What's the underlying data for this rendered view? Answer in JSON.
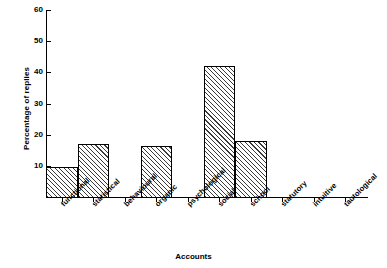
{
  "chart_data": {
    "type": "bar",
    "title": "",
    "xlabel": "Accounts",
    "ylabel": "Percentage of replies",
    "categories": [
      "functional",
      "statistical",
      "behavioural",
      "organic",
      "psychological",
      "social",
      "school",
      "statutory",
      "intuitive",
      "tautological"
    ],
    "values": [
      9.5,
      17,
      0,
      16.5,
      0,
      42,
      18,
      0,
      0,
      0
    ],
    "ylim": [
      0,
      60
    ],
    "yticks": [
      10,
      20,
      30,
      40,
      50,
      60
    ],
    "ytick_labels": [
      "10",
      "20",
      "30",
      "40",
      "50",
      "60"
    ],
    "grid": false,
    "legend": null,
    "bar_style": {
      "fill": "diagonal-hatch",
      "edge_color": "#000000",
      "face_color": "#ffffff",
      "hatch_color": "#3a3a3a"
    }
  },
  "colors": {
    "axis": "#000000",
    "background": "#ffffff",
    "text": "#000000"
  }
}
